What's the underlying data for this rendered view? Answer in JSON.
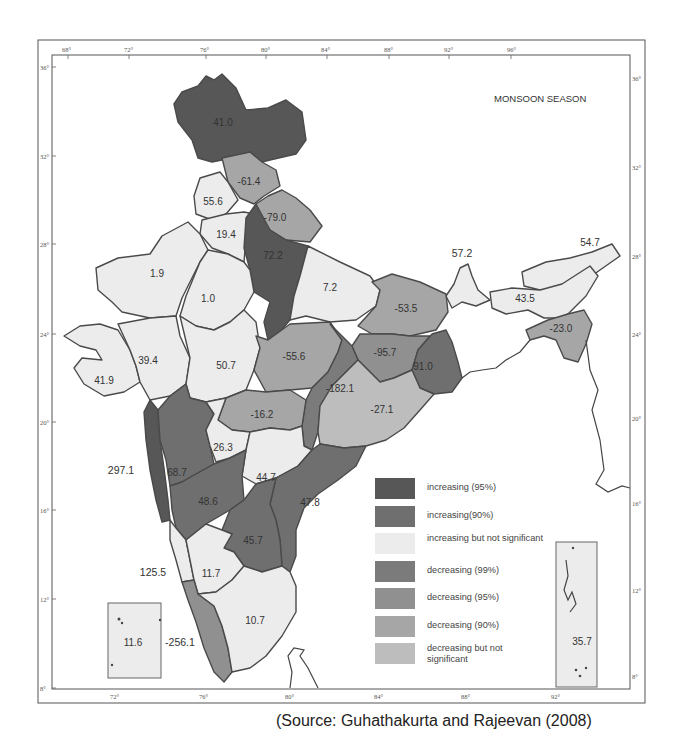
{
  "map": {
    "title": "MONSOON SEASON",
    "source": "(Source: Guhathakurta and Rajeevan (2008)",
    "longitude_ticks": [
      "68°",
      "72°",
      "76°",
      "80°",
      "84°",
      "88°",
      "92°",
      "96°"
    ],
    "latitude_ticks": [
      "36°",
      "32°",
      "28°",
      "24°",
      "20°",
      "16°",
      "12°",
      "8°"
    ],
    "colors": {
      "increasing_95": "#575757",
      "increasing_90": "#6f6f6f",
      "increasing_ns": "#ececec",
      "decreasing_99": "#7b7b7b",
      "decreasing_95": "#909090",
      "decreasing_90": "#a6a6a6",
      "decreasing_ns": "#bdbdbd"
    },
    "regions": [
      {
        "value": "41.0",
        "category": "increasing (95%)"
      },
      {
        "value": "-61.4",
        "category": "decreasing (90%)"
      },
      {
        "value": "55.6",
        "category": "increasing but not significant"
      },
      {
        "value": "-79.0",
        "category": "decreasing (90%)"
      },
      {
        "value": "19.4",
        "category": "increasing but not significant"
      },
      {
        "value": "72.2",
        "category": "increasing (95%)"
      },
      {
        "value": "1.9",
        "category": "increasing but not significant"
      },
      {
        "value": "1.0",
        "category": "increasing but not significant"
      },
      {
        "value": "7.2",
        "category": "increasing but not significant"
      },
      {
        "value": "57.2",
        "category": "increasing but not significant"
      },
      {
        "value": "54.7",
        "category": "increasing but not significant"
      },
      {
        "value": "43.5",
        "category": "increasing but not significant"
      },
      {
        "value": "-53.5",
        "category": "decreasing (90%)"
      },
      {
        "value": "-23.0",
        "category": "decreasing (90%)"
      },
      {
        "value": "39.4",
        "category": "increasing but not significant"
      },
      {
        "value": "41.9",
        "category": "increasing but not significant"
      },
      {
        "value": "50.7",
        "category": "increasing but not significant"
      },
      {
        "value": "-55.6",
        "category": "decreasing (90%)"
      },
      {
        "value": "-95.7",
        "category": "decreasing (95%)"
      },
      {
        "value": "91.0",
        "category": "increasing (90%)"
      },
      {
        "value": "-182.1",
        "category": "decreasing (99%)"
      },
      {
        "value": "-16.2",
        "category": "decreasing (90%)"
      },
      {
        "value": "-27.1",
        "category": "decreasing but not significant"
      },
      {
        "value": "297.1",
        "category": "increasing (95%)"
      },
      {
        "value": "68.7",
        "category": "increasing (90%)"
      },
      {
        "value": "26.3",
        "category": "increasing but not significant"
      },
      {
        "value": "44.7",
        "category": "increasing but not significant"
      },
      {
        "value": "48.6",
        "category": "increasing (90%)"
      },
      {
        "value": "47.8",
        "category": "increasing (90%)"
      },
      {
        "value": "45.7",
        "category": "increasing (90%)"
      },
      {
        "value": "125.5",
        "category": "increasing but not significant"
      },
      {
        "value": "11.7",
        "category": "increasing but not significant"
      },
      {
        "value": "10.7",
        "category": "increasing but not significant"
      },
      {
        "value": "-256.1",
        "category": "decreasing (95%)"
      },
      {
        "value": "11.6",
        "category": "increasing but not significant"
      },
      {
        "value": "35.7",
        "category": "increasing but not significant"
      }
    ]
  },
  "legend": {
    "items": [
      {
        "label": "increasing (95%)"
      },
      {
        "label": "increasing(90%)"
      },
      {
        "label": "increasing but not significant"
      },
      {
        "label": "decreasing (99%)"
      },
      {
        "label": "decreasing (95%)"
      },
      {
        "label": "decreasing (90%)"
      },
      {
        "label": "decreasing but not significant"
      }
    ]
  }
}
